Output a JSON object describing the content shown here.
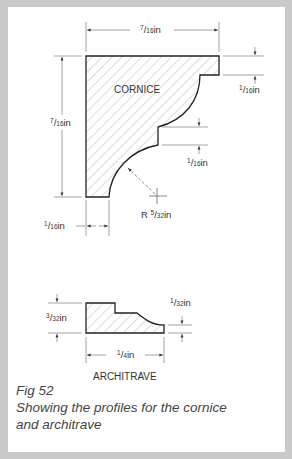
{
  "figure": {
    "number": "Fig 52",
    "description_line1": "Showing the profiles for the cornice",
    "description_line2": "and architrave"
  },
  "cornice": {
    "title": "CORNICE",
    "dimensions": {
      "width": {
        "num": "7",
        "den": "16",
        "unit": "in"
      },
      "height": {
        "num": "7",
        "den": "16",
        "unit": "in"
      },
      "top_step": {
        "num": "1",
        "den": "16",
        "unit": "in"
      },
      "middle_step": {
        "num": "1",
        "den": "16",
        "unit": "in"
      },
      "bottom_foot": {
        "num": "1",
        "den": "16",
        "unit": "in"
      },
      "radius": {
        "prefix": "R ",
        "num": "5",
        "den": "32",
        "unit": "in"
      }
    }
  },
  "architrave": {
    "title": "ARCHITRAVE",
    "dimensions": {
      "height": {
        "num": "3",
        "den": "32",
        "unit": "in"
      },
      "right_step": {
        "num": "1",
        "den": "32",
        "unit": "in"
      },
      "width": {
        "num": "1",
        "den": "4",
        "unit": "in"
      }
    }
  },
  "colors": {
    "border": "#c9c9c9",
    "line": "#222222",
    "dim_line": "#555555",
    "hatch": "#9a9a9a"
  }
}
